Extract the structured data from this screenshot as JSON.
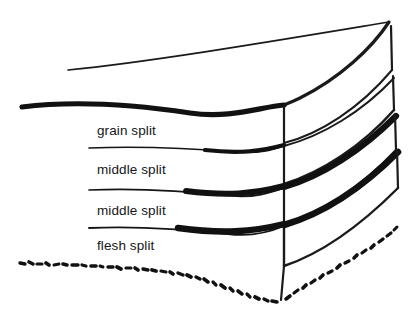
{
  "diagram": {
    "background_color": "#ffffff",
    "ink_color": "#111111",
    "labels": [
      {
        "id": "grain-split",
        "text": "grain split"
      },
      {
        "id": "middle-split-1",
        "text": "middle split"
      },
      {
        "id": "middle-split-2",
        "text": "middle split"
      },
      {
        "id": "flesh-split",
        "text": "flesh split"
      }
    ],
    "strokes": {
      "thin_top_edge": "thin curved line along top surface of hide",
      "thick_separators": "thick tapered ink lines dividing each split layer",
      "dotted_bottom_edge": "irregular dotted line marking rough flesh side"
    }
  }
}
